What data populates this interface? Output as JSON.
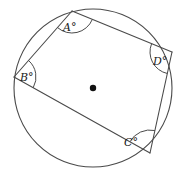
{
  "figure": {
    "kind": "cyclic-quadrilateral-in-circle",
    "background_color": "#ffffff",
    "stroke_color": "#4a4a4a",
    "label_color": "#1a1a1a",
    "circle": {
      "center_x": 93,
      "center_y": 88,
      "radius": 79,
      "center_dot_radius": 3.2
    },
    "vertices": [
      {
        "id": "A",
        "label": "A°",
        "x": 72,
        "y": 11,
        "label_x": 63,
        "label_y": 22,
        "arc_radius": 22,
        "arc_start_deg": 311,
        "arc_end_deg": 48
      },
      {
        "id": "B",
        "label": "B°",
        "x": 14,
        "y": 77,
        "label_x": 20,
        "label_y": 72,
        "arc_radius": 22,
        "arc_start_deg": 297,
        "arc_end_deg": 29
      },
      {
        "id": "C",
        "label": "C°",
        "x": 150,
        "y": 153,
        "label_x": 124,
        "label_y": 137,
        "arc_radius": 23,
        "arc_start_deg": 151,
        "arc_end_deg": 260
      },
      {
        "id": "D",
        "label": "D°",
        "x": 172,
        "y": 52,
        "label_x": 153,
        "label_y": 56,
        "arc_radius": 22,
        "arc_start_deg": 102,
        "arc_end_deg": 203
      }
    ],
    "edges": [
      {
        "from": "A",
        "to": "B"
      },
      {
        "from": "B",
        "to": "C"
      },
      {
        "from": "C",
        "to": "D"
      },
      {
        "from": "D",
        "to": "A"
      }
    ]
  }
}
